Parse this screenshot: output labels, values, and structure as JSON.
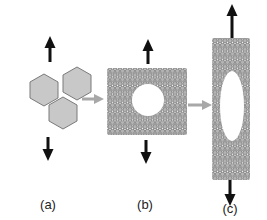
{
  "figure": {
    "colors": {
      "grain_fill": "#c8c8c8",
      "grain_stroke": "#7a7a7a",
      "atom_fill": "#b4b4b4",
      "atom_stroke": "#5a5a5a",
      "load_arrow": "#111111",
      "transition_arrow": "#a8a8a8"
    },
    "panels": [
      {
        "id": "a",
        "label": "(a)",
        "content": "three hexagonal grains",
        "load": "tension up/down"
      },
      {
        "id": "b",
        "label": "(b)",
        "content": "atomic lattice with circular hole",
        "load": "tension up/down"
      },
      {
        "id": "c",
        "label": "(c)",
        "content": "elongated lattice with elliptical hole",
        "load": "tension up/down"
      }
    ],
    "transitions": [
      {
        "from": "a",
        "to": "b",
        "icon": "arrow-right-icon"
      },
      {
        "from": "b",
        "to": "c",
        "icon": "arrow-right-icon"
      }
    ]
  }
}
